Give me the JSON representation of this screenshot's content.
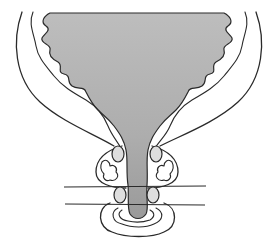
{
  "figure": {
    "type": "anatomical-line-drawing",
    "labels": [],
    "colors": {
      "background": "#ffffff",
      "stroke": "#2a2a2a",
      "lumen_fill_top": "#b9b9b9",
      "lumen_fill_bottom": "#9c9c9c",
      "gland_fill": "#dedede"
    }
  }
}
